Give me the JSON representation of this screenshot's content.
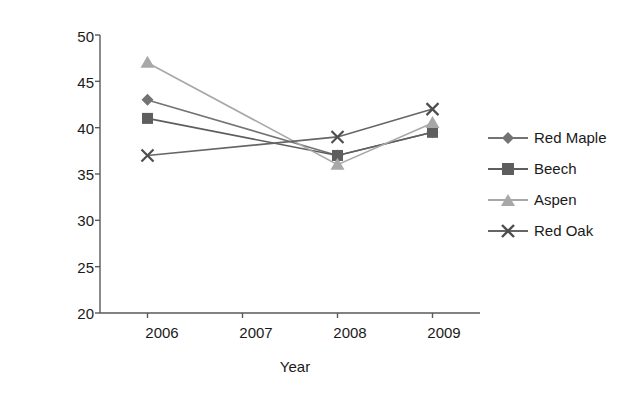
{
  "chart_data": {
    "type": "line",
    "title": "",
    "xlabel": "Year",
    "ylabel": "Log moisture content (%)",
    "categories": [
      "2006",
      "2007",
      "2008",
      "2009"
    ],
    "x": [
      2006,
      2007,
      2008,
      2009
    ],
    "xlim": [
      2005.5,
      2009.5
    ],
    "ylim": [
      20,
      50
    ],
    "yticks": [
      20,
      25,
      30,
      35,
      40,
      45,
      50
    ],
    "xticks": [
      "2006",
      "2007",
      "2008",
      "2009"
    ],
    "grid": false,
    "legend_position": "right",
    "series": [
      {
        "name": "Red Maple",
        "marker": "diamond",
        "color": "#737373",
        "x": [
          2006,
          2008,
          2009
        ],
        "values": [
          43,
          37,
          39.5
        ]
      },
      {
        "name": "Beech",
        "marker": "square",
        "color": "#5e5e5e",
        "x": [
          2006,
          2008,
          2009
        ],
        "values": [
          41,
          37,
          39.5
        ]
      },
      {
        "name": "Aspen",
        "marker": "triangle",
        "color": "#a8a8a8",
        "x": [
          2006,
          2008,
          2009
        ],
        "values": [
          47,
          36,
          40.5
        ]
      },
      {
        "name": "Red Oak",
        "marker": "cross",
        "color": "#666666",
        "x": [
          2006,
          2008,
          2009
        ],
        "values": [
          37,
          39,
          42
        ]
      }
    ]
  },
  "axis": {
    "y_labels": [
      "50",
      "45",
      "40",
      "35",
      "30",
      "25",
      "20"
    ],
    "x_labels": [
      "2006",
      "2007",
      "2008",
      "2009"
    ],
    "y_title": "Log moisture content (%)",
    "x_title": "Year"
  },
  "legend": {
    "items": [
      {
        "label": "Red Maple",
        "marker": "diamond-marker-icon",
        "color": "#737373"
      },
      {
        "label": "Beech",
        "marker": "square-marker-icon",
        "color": "#5e5e5e"
      },
      {
        "label": "Aspen",
        "marker": "triangle-marker-icon",
        "color": "#a8a8a8"
      },
      {
        "label": "Red Oak",
        "marker": "cross-marker-icon",
        "color": "#666666"
      }
    ]
  },
  "colors": {
    "axis": "#595959",
    "text": "#1a1a1a",
    "background": "#ffffff"
  }
}
